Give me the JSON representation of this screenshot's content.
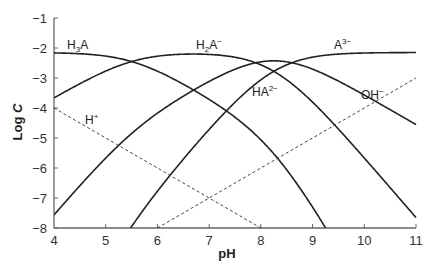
{
  "chart_data": {
    "type": "line",
    "title": "",
    "xlabel": "pH",
    "ylabel": "Log C",
    "xlim": [
      4,
      11
    ],
    "ylim": [
      -8,
      -1
    ],
    "xticks": [
      4,
      5,
      6,
      7,
      8,
      9,
      10,
      11
    ],
    "yticks": [
      -1,
      -2,
      -3,
      -4,
      -5,
      -6,
      -7,
      -8
    ],
    "grid": false,
    "legend": "inline labels",
    "model": {
      "log_total_concentration": -2.15,
      "pKa": [
        5.5,
        7.9,
        8.6
      ],
      "pKw": 14
    },
    "x": [
      4,
      5,
      6,
      7,
      8,
      9,
      10,
      11
    ],
    "series": [
      {
        "name": "H3A",
        "style": "solid",
        "values": [
          -2.16,
          -2.26,
          -2.85,
          -3.84,
          -5.2,
          -7.0,
          -8.97,
          -10.96
        ]
      },
      {
        "name": "H2A-",
        "style": "solid",
        "values": [
          -3.66,
          -2.76,
          -2.35,
          -2.34,
          -2.7,
          -3.5,
          -5.47,
          -7.46
        ]
      },
      {
        "name": "HA2-",
        "style": "solid",
        "values": [
          -7.56,
          -5.66,
          -4.25,
          -3.24,
          -2.9,
          -3.4,
          -4.37,
          -5.36
        ]
      },
      {
        "name": "A3-",
        "style": "solid",
        "values": [
          -12.16,
          -9.26,
          -6.85,
          -4.84,
          -3.5,
          -2.48,
          -2.21,
          -2.16
        ]
      },
      {
        "name": "H+",
        "style": "dashed",
        "values": [
          -4,
          -5,
          -6,
          -7,
          -8,
          null,
          null,
          null
        ]
      },
      {
        "name": "OH-",
        "style": "dashed",
        "values": [
          null,
          null,
          -8,
          -7,
          -6,
          -5,
          -4,
          -3
        ]
      }
    ],
    "annotations": [
      {
        "text": "H3A",
        "x": 4.3,
        "y": -2.0
      },
      {
        "text": "H2A-",
        "x": 6.5,
        "y": -2.0
      },
      {
        "text": "A3-",
        "x": 9.4,
        "y": -2.0
      },
      {
        "text": "HA2-",
        "x": 7.8,
        "y": -3.3
      },
      {
        "text": "H+",
        "x": 5.1,
        "y": -4.3
      },
      {
        "text": "OH-",
        "x": 9.5,
        "y": -4.2
      }
    ]
  },
  "axes": {
    "x_title": "pH",
    "y_title_main": "Log ",
    "y_title_italic": "C",
    "x_tick_labels": [
      "4",
      "5",
      "6",
      "7",
      "8",
      "9",
      "10",
      "11"
    ],
    "y_tick_labels": [
      "−1",
      "−2",
      "−3",
      "−4",
      "−5",
      "−6",
      "−7",
      "−8"
    ]
  },
  "labels": {
    "h3a": {
      "base": "H",
      "sub": "3",
      "tail": "A",
      "sup": ""
    },
    "h2a": {
      "base": "H",
      "sub": "2",
      "tail": "A",
      "sup": "−"
    },
    "ha": {
      "base": "HA",
      "sub": "",
      "tail": "",
      "sup": "2−"
    },
    "a": {
      "base": "A",
      "sub": "",
      "tail": "",
      "sup": "3−"
    },
    "h": {
      "base": "H",
      "sub": "",
      "tail": "",
      "sup": "+"
    },
    "oh": {
      "base": "OH",
      "sub": "",
      "tail": "",
      "sup": "−"
    }
  },
  "colors": {
    "curve": "#222222",
    "axis": "#555555",
    "dashed": "#444444"
  }
}
